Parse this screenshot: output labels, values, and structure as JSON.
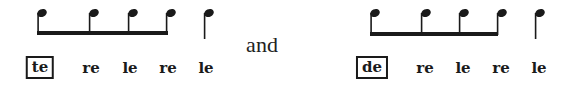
{
  "figure": {
    "connector": "and",
    "patterns": [
      {
        "id": "pattern-1",
        "notes": [
          "eighth",
          "eighth",
          "eighth",
          "eighth",
          "quarter"
        ],
        "beamed_notes": 4,
        "syllables": [
          "te",
          "re",
          "le",
          "re",
          "le"
        ],
        "boxed_syllable_index": 0
      },
      {
        "id": "pattern-2",
        "notes": [
          "eighth",
          "eighth",
          "eighth",
          "eighth",
          "quarter"
        ],
        "beamed_notes": 4,
        "syllables": [
          "de",
          "re",
          "le",
          "re",
          "le"
        ],
        "boxed_syllable_index": 0
      }
    ],
    "colors": {
      "ink": "#1a1a1a",
      "background": "#ffffff"
    }
  }
}
